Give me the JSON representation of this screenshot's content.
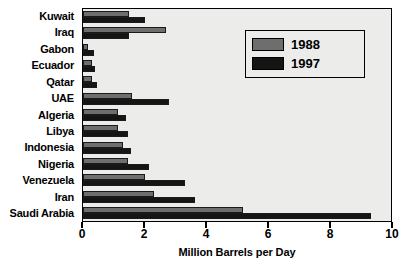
{
  "chart_data": {
    "type": "bar",
    "orientation": "horizontal",
    "title": "",
    "xlabel": "Million Barrels per Day",
    "ylabel": "",
    "xlim": [
      0,
      10
    ],
    "xticks": [
      0,
      2,
      4,
      6,
      8,
      10
    ],
    "xtick_labels": [
      "0",
      "2",
      "4",
      "6",
      "8",
      "10"
    ],
    "grid": false,
    "legend_position": "upper right",
    "categories": [
      "Kuwait",
      "Iraq",
      "Gabon",
      "Ecuador",
      "Qatar",
      "UAE",
      "Algeria",
      "Libya",
      "Indonesia",
      "Nigeria",
      "Venezuela",
      "Iran",
      "Saudi Arabia"
    ],
    "series": [
      {
        "name": "1988",
        "color": "#6e6e6e",
        "values": [
          1.5,
          2.7,
          0.15,
          0.3,
          0.3,
          1.6,
          1.15,
          1.15,
          1.3,
          1.45,
          2.0,
          2.3,
          5.2
        ]
      },
      {
        "name": "1997",
        "color": "#151515",
        "values": [
          2.0,
          1.5,
          0.35,
          0.4,
          0.45,
          2.8,
          1.4,
          1.45,
          1.55,
          2.15,
          3.3,
          3.65,
          9.35
        ]
      }
    ]
  },
  "legend": {
    "entries": [
      {
        "label": "1988",
        "swatch": "gray"
      },
      {
        "label": "1997",
        "swatch": "black"
      }
    ]
  },
  "colors": {
    "series_1988": "#6e6e6e",
    "series_1997": "#151515",
    "plot_background": "#ececeb",
    "axis": "#000000"
  }
}
